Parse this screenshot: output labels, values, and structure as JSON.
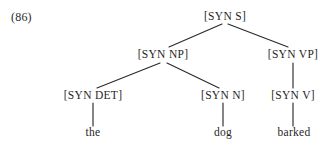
{
  "figure": {
    "example_number": "(86)",
    "sentence": "the dog barked",
    "caption": "",
    "ink_color": "#2a2a2a",
    "background_color": "#ffffff"
  },
  "tree": {
    "root_label": "[SYN S]",
    "nodes": [
      {
        "id": "s",
        "label": "[SYN S]",
        "x": 225,
        "y": 17,
        "level": 0,
        "kind": "nonterminal"
      },
      {
        "id": "np",
        "label": "[SYN NP]",
        "x": 163,
        "y": 55,
        "level": 1,
        "kind": "nonterminal"
      },
      {
        "id": "vp",
        "label": "[SYN VP]",
        "x": 293,
        "y": 55,
        "level": 1,
        "kind": "nonterminal"
      },
      {
        "id": "det",
        "label": "[SYN DET]",
        "x": 93,
        "y": 96,
        "level": 2,
        "kind": "nonterminal"
      },
      {
        "id": "n",
        "label": "[SYN N]",
        "x": 223,
        "y": 96,
        "level": 2,
        "kind": "nonterminal"
      },
      {
        "id": "v",
        "label": "[SYN V]",
        "x": 293,
        "y": 96,
        "level": 2,
        "kind": "nonterminal"
      }
    ],
    "leaves": [
      {
        "id": "the",
        "label": "the",
        "x": 93,
        "y": 133,
        "parent": "det"
      },
      {
        "id": "dog",
        "label": "dog",
        "x": 223,
        "y": 133,
        "parent": "n"
      },
      {
        "id": "barked",
        "label": "barked",
        "x": 294,
        "y": 133,
        "parent": "v"
      }
    ],
    "edges": [
      {
        "from": "s",
        "to": "np",
        "x1": 222,
        "y1": 24,
        "x2": 169,
        "y2": 47
      },
      {
        "from": "s",
        "to": "vp",
        "x1": 228,
        "y1": 24,
        "x2": 288,
        "y2": 47
      },
      {
        "from": "np",
        "to": "det",
        "x1": 160,
        "y1": 63,
        "x2": 97,
        "y2": 88
      },
      {
        "from": "np",
        "to": "n",
        "x1": 167,
        "y1": 63,
        "x2": 219,
        "y2": 88
      },
      {
        "from": "vp",
        "to": "v",
        "x1": 293,
        "y1": 63,
        "x2": 293,
        "y2": 88
      },
      {
        "from": "det",
        "to": "the",
        "x1": 93,
        "y1": 103,
        "x2": 93,
        "y2": 126
      },
      {
        "from": "n",
        "to": "dog",
        "x1": 223,
        "y1": 103,
        "x2": 223,
        "y2": 126
      },
      {
        "from": "v",
        "to": "barked",
        "x1": 293,
        "y1": 103,
        "x2": 293,
        "y2": 126
      }
    ]
  }
}
